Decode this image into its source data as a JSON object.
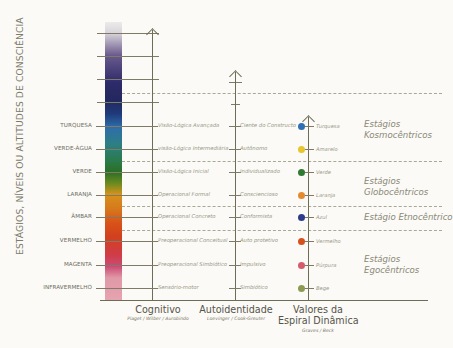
{
  "title_vertical": "ESTÁGIOS, NÍVEIS OU ALTITUDES DE CONSCIÊNCIA",
  "levels": [
    {
      "name": "TURQUESA",
      "y": 126,
      "cognitive": "Visão-Lógica Avançada",
      "identity": "Ciente do Constructo",
      "spiral": "Turquesa",
      "spiral_color": "#2f6fb4"
    },
    {
      "name": "VERDE-ÁGUA",
      "y": 149,
      "cognitive": "visão-Lógica Intermediária",
      "identity": "Autônomo",
      "spiral": "Amarelo",
      "spiral_color": "#e8c52c"
    },
    {
      "name": "VERDE",
      "y": 172,
      "cognitive": "Visão-Lógica Inicial",
      "identity": "Individualizado",
      "spiral": "Verde",
      "spiral_color": "#2e7a30"
    },
    {
      "name": "LARANJA",
      "y": 195,
      "cognitive": "Operacional Formal",
      "identity": "Consciencioso",
      "spiral": "Laranja",
      "spiral_color": "#e8882c"
    },
    {
      "name": "ÂMBAR",
      "y": 217,
      "cognitive": "Operacional Concreto",
      "identity": "Conformista",
      "spiral": "Azul",
      "spiral_color": "#2a3c8a"
    },
    {
      "name": "VERMELHO",
      "y": 241,
      "cognitive": "Preoperacional Conceitual",
      "identity": "Auto protetivo",
      "spiral": "Vermelho",
      "spiral_color": "#d8501c"
    },
    {
      "name": "MAGENTA",
      "y": 265,
      "cognitive": "Preoperacional Simbiótico",
      "identity": "Impulsivo",
      "spiral": "Púrpura",
      "spiral_color": "#d65a6c"
    },
    {
      "name": "INFRAVERMELHO",
      "y": 288,
      "cognitive": "Sensório-motor",
      "identity": "Simbiótico",
      "spiral": "Bege",
      "spiral_color": "#8c9a52"
    }
  ],
  "stage_groups": [
    {
      "label_line1": "Estágios",
      "label_line2": "Kosmocêntricos",
      "y": 119
    },
    {
      "label_line1": "Estágios",
      "label_line2": "Globocêntricos",
      "y": 176
    },
    {
      "label_line1": "Estágio Etnocêntrico",
      "label_line2": "",
      "y": 212
    },
    {
      "label_line1": "Estágios",
      "label_line2": "Egocêntricos",
      "y": 254
    }
  ],
  "columns": [
    {
      "title": "Cognitivo",
      "title2": "",
      "source": "Piaget / Wilber / Aurobindo"
    },
    {
      "title": "Autoidentidade",
      "title2": "",
      "source": "Loevinger / Cook-Greuter"
    },
    {
      "title": "Valores da",
      "title2": "Espiral Dinâmica",
      "source": "Graves / Beck"
    }
  ]
}
